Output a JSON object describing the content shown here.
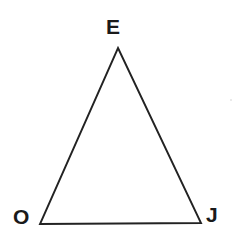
{
  "figure": {
    "type": "triangle-diagram",
    "canvas": {
      "width": 244,
      "height": 245,
      "background": "#ffffff"
    },
    "stroke": {
      "color": "#222222",
      "width": 1.9
    },
    "label_color": "#1a1a1a"
  },
  "shape": {
    "name": "triangle-OEJ",
    "vertices": [
      {
        "id": "E",
        "label": "E",
        "x": 118,
        "y": 48,
        "position": "apex-top"
      },
      {
        "id": "O",
        "label": "O",
        "x": 40,
        "y": 224,
        "position": "bottom-left"
      },
      {
        "id": "J",
        "label": "J",
        "x": 201,
        "y": 223,
        "position": "bottom-right"
      }
    ],
    "points_path": "118,48 201,223 40,224",
    "edges": [
      {
        "id": "EO",
        "from": "E",
        "to": "O"
      },
      {
        "id": "OJ",
        "from": "O",
        "to": "J"
      },
      {
        "id": "JE",
        "from": "J",
        "to": "E"
      }
    ]
  },
  "labels": {
    "apex": {
      "text": "E",
      "name": "vertex-label-e"
    },
    "bottom_left": {
      "text": "O",
      "name": "vertex-label-o"
    },
    "bottom_right": {
      "text": "J",
      "name": "vertex-label-j"
    }
  }
}
